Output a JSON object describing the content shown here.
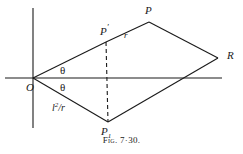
{
  "figure": {
    "caption": "Fig. 7·30.",
    "stroke_color": "#1a1a1a",
    "background_color": "#ffffff",
    "labels": {
      "origin": "O",
      "p_prime_base": "P",
      "p_prime_mark": "′",
      "p_top": "P",
      "r_side": "r",
      "r_right": "R",
      "p_one_base": "P",
      "p_one_sub": "1",
      "theta_upper": "θ",
      "theta_lower": "θ",
      "frac_base": "l",
      "frac_exp": "2",
      "frac_rest": "/r"
    },
    "points": {
      "O": [
        33,
        78
      ],
      "P_prime": [
        106,
        42
      ],
      "P": [
        149,
        22
      ],
      "R": [
        218,
        58
      ],
      "P1": [
        108,
        122
      ]
    },
    "axes": {
      "x_axis": [
        5,
        78,
        222,
        78
      ],
      "y_axis": [
        33,
        8,
        33,
        128
      ]
    },
    "dashed_segment": [
      106,
      42,
      108,
      122
    ]
  }
}
